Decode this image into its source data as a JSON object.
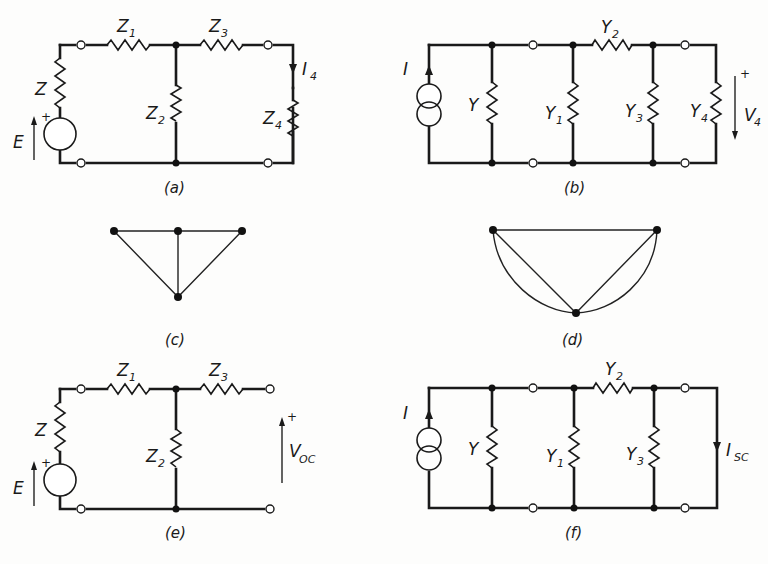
{
  "figure": {
    "panels": [
      {
        "id": "a",
        "caption": "(a)",
        "type": "circuit",
        "labels": {
          "source": "E",
          "source_polarity": "+",
          "series_z": "Z",
          "z1": "Z",
          "z1_sub": "1",
          "z2": "Z",
          "z2_sub": "2",
          "z3": "Z",
          "z3_sub": "3",
          "z4": "Z",
          "z4_sub": "4",
          "current": "I",
          "current_sub": "4"
        }
      },
      {
        "id": "b",
        "caption": "(b)",
        "type": "circuit",
        "labels": {
          "source": "I",
          "y": "Y",
          "y1": "Y",
          "y1_sub": "1",
          "y2": "Y",
          "y2_sub": "2",
          "y3": "Y",
          "y3_sub": "3",
          "y4": "Y",
          "y4_sub": "4",
          "voltage": "V",
          "voltage_sub": "4",
          "voltage_polarity": "+"
        }
      },
      {
        "id": "c",
        "caption": "(c)",
        "type": "graph"
      },
      {
        "id": "d",
        "caption": "(d)",
        "type": "graph"
      },
      {
        "id": "e",
        "caption": "(e)",
        "type": "circuit",
        "labels": {
          "source": "E",
          "source_polarity": "+",
          "series_z": "Z",
          "z1": "Z",
          "z1_sub": "1",
          "z2": "Z",
          "z2_sub": "2",
          "z3": "Z",
          "z3_sub": "3",
          "voltage": "V",
          "voltage_sub": "OC",
          "voltage_polarity": "+"
        }
      },
      {
        "id": "f",
        "caption": "(f)",
        "type": "circuit",
        "labels": {
          "source": "I",
          "y": "Y",
          "y1": "Y",
          "y1_sub": "1",
          "y2": "Y",
          "y2_sub": "2",
          "y3": "Y",
          "y3_sub": "3",
          "current": "I",
          "current_sub": "SC"
        }
      }
    ]
  }
}
